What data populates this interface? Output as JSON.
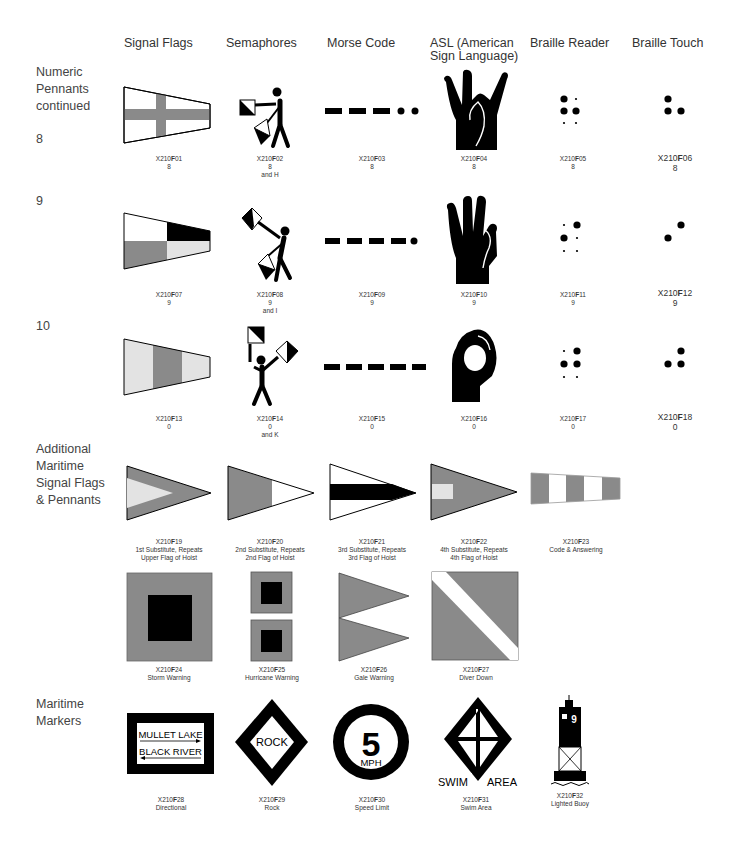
{
  "columns": [
    {
      "label": "Signal Flags",
      "x": 124
    },
    {
      "label": "Semaphores",
      "x": 226
    },
    {
      "label": "Morse Code",
      "x": 327
    },
    {
      "label": "ASL (American Sign Language)",
      "x": 430
    },
    {
      "label": "Braille Reader",
      "x": 530
    },
    {
      "label": "Braille Touch",
      "x": 632
    }
  ],
  "row_labels": {
    "numeric_pennants": "Numeric Pennants continued",
    "numeric_pennants_lines": [
      "Numeric",
      "Pennants",
      "continued"
    ],
    "eight": "8",
    "nine": "9",
    "ten": "10",
    "additional_lines": [
      "Additional",
      "Maritime",
      "Signal Flags",
      "& Pennants"
    ],
    "markers_lines": [
      "Maritime",
      "Markers"
    ]
  },
  "captions": {
    "F01": {
      "code_prefix": "X210",
      "code_bold": "F",
      "code_suffix": "01",
      "lines": [
        "8"
      ]
    },
    "F02": {
      "code_prefix": "X210",
      "code_bold": "F",
      "code_suffix": "02",
      "lines": [
        "8",
        "and H"
      ]
    },
    "F03": {
      "code_prefix": "X210",
      "code_bold": "F",
      "code_suffix": "03",
      "lines": [
        "8"
      ]
    },
    "F04": {
      "code_prefix": "X210",
      "code_bold": "F",
      "code_suffix": "04",
      "lines": [
        "8"
      ]
    },
    "F05": {
      "code_prefix": "X210",
      "code_bold": "F",
      "code_suffix": "05",
      "lines": [
        "8"
      ]
    },
    "F06": {
      "code_prefix": "X210",
      "code_bold": "F",
      "code_suffix": "06",
      "lines": [
        "8"
      ]
    },
    "F07": {
      "code_prefix": "X210",
      "code_bold": "F",
      "code_suffix": "07",
      "lines": [
        "9"
      ]
    },
    "F08": {
      "code_prefix": "X210",
      "code_bold": "F",
      "code_suffix": "08",
      "lines": [
        "9",
        "and I"
      ]
    },
    "F09": {
      "code_prefix": "X210",
      "code_bold": "F",
      "code_suffix": "09",
      "lines": [
        "9"
      ]
    },
    "F10": {
      "code_prefix": "X210",
      "code_bold": "F",
      "code_suffix": "10",
      "lines": [
        "9"
      ]
    },
    "F11": {
      "code_prefix": "X210",
      "code_bold": "F",
      "code_suffix": "11",
      "lines": [
        "9"
      ]
    },
    "F12": {
      "code_prefix": "X210",
      "code_bold": "F",
      "code_suffix": "12",
      "lines": [
        "9"
      ]
    },
    "F13": {
      "code_prefix": "X210",
      "code_bold": "F",
      "code_suffix": "13",
      "lines": [
        "0"
      ]
    },
    "F14": {
      "code_prefix": "X210",
      "code_bold": "F",
      "code_suffix": "14",
      "lines": [
        "0",
        "and K"
      ]
    },
    "F15": {
      "code_prefix": "X210",
      "code_bold": "F",
      "code_suffix": "15",
      "lines": [
        "0"
      ]
    },
    "F16": {
      "code_prefix": "X210",
      "code_bold": "F",
      "code_suffix": "16",
      "lines": [
        "0"
      ]
    },
    "F17": {
      "code_prefix": "X210",
      "code_bold": "F",
      "code_suffix": "17",
      "lines": [
        "0"
      ]
    },
    "F18": {
      "code_prefix": "X210",
      "code_bold": "F",
      "code_suffix": "18",
      "lines": [
        "0"
      ]
    },
    "F19": {
      "code_prefix": "X210",
      "code_bold": "F",
      "code_suffix": "19",
      "lines": [
        "1st Substitute, Repeats",
        "Upper Flag of Hoist"
      ]
    },
    "F20": {
      "code_prefix": "X210",
      "code_bold": "F",
      "code_suffix": "20",
      "lines": [
        "2nd Substitute, Repeats",
        "2nd Flag of Hoist"
      ]
    },
    "F21": {
      "code_prefix": "X210",
      "code_bold": "F",
      "code_suffix": "21",
      "lines": [
        "3rd Substitute, Repeats",
        "3rd Flag of Hoist"
      ]
    },
    "F22": {
      "code_prefix": "X210",
      "code_bold": "F",
      "code_suffix": "22",
      "lines": [
        "4th Substitute, Repeats",
        "4th Flag of Hoist"
      ]
    },
    "F23": {
      "code_prefix": "X210",
      "code_bold": "F",
      "code_suffix": "23",
      "lines": [
        "Code & Answering"
      ]
    },
    "F24": {
      "code_prefix": "X210",
      "code_bold": "F",
      "code_suffix": "24",
      "lines": [
        "Storm Warning"
      ]
    },
    "F25": {
      "code_prefix": "X210",
      "code_bold": "F",
      "code_suffix": "25",
      "lines": [
        "Hurricane Warning"
      ]
    },
    "F26": {
      "code_prefix": "X210",
      "code_bold": "F",
      "code_suffix": "26",
      "lines": [
        "Gale Warning"
      ]
    },
    "F27": {
      "code_prefix": "X210",
      "code_bold": "F",
      "code_suffix": "27",
      "lines": [
        "Diver Down"
      ]
    },
    "F28": {
      "code_prefix": "X210",
      "code_bold": "F",
      "code_suffix": "28",
      "lines": [
        "Directional"
      ]
    },
    "F29": {
      "code_prefix": "X210",
      "code_bold": "F",
      "code_suffix": "29",
      "lines": [
        "Rock"
      ]
    },
    "F30": {
      "code_prefix": "X210",
      "code_bold": "F",
      "code_suffix": "30",
      "lines": [
        "Speed Limit"
      ]
    },
    "F31": {
      "code_prefix": "X210",
      "code_bold": "F",
      "code_suffix": "31",
      "lines": [
        "Swim Area"
      ]
    },
    "F32": {
      "code_prefix": "X210",
      "code_bold": "F",
      "code_suffix": "32",
      "lines": [
        "Lighted Buoy"
      ]
    }
  },
  "sign_text": {
    "directional_top": "MULLET LAKE",
    "directional_bottom": "BLACK RIVER",
    "rock": "ROCK",
    "speed_number": "5",
    "speed_unit": "MPH",
    "swim_left": "SWIM",
    "swim_right": "AREA",
    "buoy_number": "9"
  },
  "colors": {
    "black": "#000000",
    "gray": "#8a8a8a",
    "light_gray": "#e3e3e3",
    "white": "#ffffff",
    "text": "#333333"
  }
}
